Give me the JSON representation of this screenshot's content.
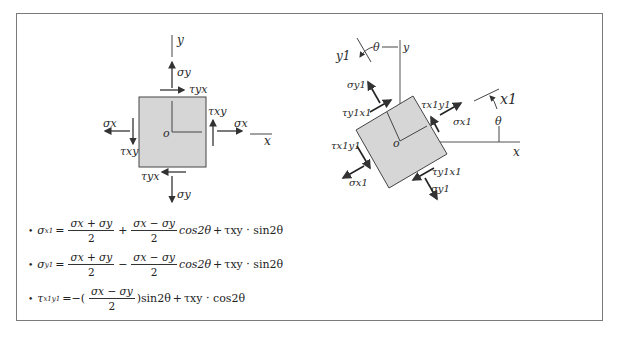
{
  "diagram_left": {
    "axis_y_label": "y",
    "axis_x_label": "x",
    "origin_label": "o",
    "sigma_x_left": "σx",
    "sigma_x_right": "σx",
    "sigma_y_top": "σy",
    "sigma_y_bottom": "σy",
    "tau_yx_top": "τyx",
    "tau_yx_bottom": "τyx",
    "tau_xy_left": "τxy",
    "tau_xy_right": "τxy",
    "fill_color": "#d6d6d6",
    "stroke_color": "#444444"
  },
  "diagram_right": {
    "axis_y_label": "y",
    "axis_x_label": "x",
    "axis_y1_label": "y1",
    "axis_x1_label": "x1",
    "origin_label": "o",
    "theta_top": "θ",
    "theta_right": "θ",
    "sigma_y1_top": "σy1",
    "sigma_y1_bottom": "σy1",
    "sigma_x1_right": "σx1",
    "sigma_x1_left": "σx1",
    "tau_y1x1_topleft": "τy1x1",
    "tau_y1x1_bottomright": "τy1x1",
    "tau_x1y1_topright": "τx1y1",
    "tau_x1y1_left": "τx1y1",
    "rotation_deg": 30
  },
  "formulas": [
    {
      "bullet": "•",
      "lhs": "σ",
      "lhs_sub": "x1",
      "eq": "=",
      "frac1_num": "σx + σy",
      "frac1_den": "2",
      "op1": "+",
      "frac2_num": "σx − σy",
      "frac2_den": "2",
      "term2": "cos2θ",
      "op2": "+",
      "term3": "τxy · sin2θ"
    },
    {
      "bullet": "•",
      "lhs": "σ",
      "lhs_sub": "y1",
      "eq": "=",
      "frac1_num": "σx + σy",
      "frac1_den": "2",
      "op1": "−",
      "frac2_num": "σx − σy",
      "frac2_den": "2",
      "term2": "cos2θ",
      "op2": "+",
      "term3": "τxy · sin2θ"
    },
    {
      "bullet": "•",
      "lhs": "τ",
      "lhs_sub": "x1y1",
      "eq": "=−(",
      "frac_num": "σx − σy",
      "frac_den": "2",
      "after": ")sin2θ",
      "op2": "+",
      "term3": "τxy · cos2θ"
    }
  ]
}
